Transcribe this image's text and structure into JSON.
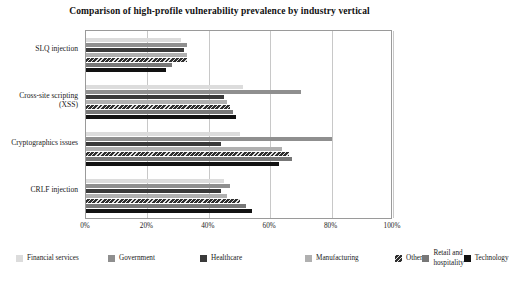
{
  "chart_data": {
    "type": "bar",
    "orientation": "horizontal",
    "title": "Comparison of high-profile vulnerability prevalence by industry vertical",
    "xlabel": "",
    "ylabel": "",
    "xlim": [
      0,
      100
    ],
    "xticks": [
      "0%",
      "20%",
      "40%",
      "60%",
      "80%",
      "100%"
    ],
    "xtick_values": [
      0,
      20,
      40,
      60,
      80,
      100
    ],
    "grid": true,
    "legend_position": "bottom",
    "categories": [
      "SLQ injection",
      "Cross-site scripting (XSS)",
      "Cryptographics issues",
      "CRLF injection"
    ],
    "series": [
      {
        "name": "Financial services",
        "color": "#dcdcdc",
        "values": [
          31,
          51,
          50,
          45
        ]
      },
      {
        "name": "Government",
        "color": "#8f8f8f",
        "values": [
          33,
          70,
          80,
          47
        ]
      },
      {
        "name": "Healthcare",
        "color": "#3a3a3a",
        "values": [
          32,
          45,
          44,
          44
        ]
      },
      {
        "name": "Manufacturing",
        "color": "#b0b0b0",
        "values": [
          33,
          46,
          64,
          46
        ]
      },
      {
        "name": "Other",
        "color": "#2e2e2e",
        "values": [
          33,
          47,
          66,
          50
        ]
      },
      {
        "name": "Retail and hospitality",
        "color": "#777777",
        "values": [
          28,
          48,
          67,
          52
        ]
      },
      {
        "name": "Technology",
        "color": "#121212",
        "values": [
          26,
          49,
          63,
          54
        ]
      }
    ]
  },
  "legend": {
    "items": [
      {
        "label": "Financial services",
        "swatch": "legend-swatch-financial-services"
      },
      {
        "label": "Government",
        "swatch": "legend-swatch-government"
      },
      {
        "label": "Healthcare",
        "swatch": "legend-swatch-healthcare"
      },
      {
        "label": "Manufacturing",
        "swatch": "legend-swatch-manufacturing"
      },
      {
        "label": "Other",
        "swatch": "legend-swatch-other"
      },
      {
        "label": "Retail and hospitality",
        "swatch": "legend-swatch-retail-and-hospitality"
      },
      {
        "label": "Technology",
        "swatch": "legend-swatch-technology"
      }
    ]
  }
}
